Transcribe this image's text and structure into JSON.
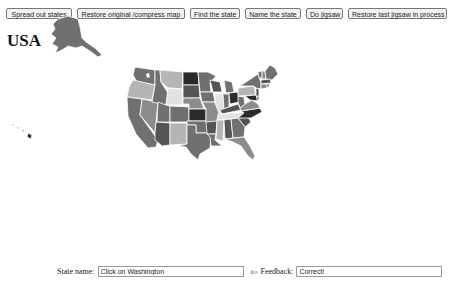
{
  "toolbar": {
    "buttons": [
      {
        "label": "Spread out states"
      },
      {
        "label": "Restore original /compress map"
      },
      {
        "label": "Find the state"
      },
      {
        "label": "Name the state"
      },
      {
        "label": "Do jigsaw"
      },
      {
        "label": "Restore last jigsaw in process"
      }
    ]
  },
  "map": {
    "title": "USA",
    "colors": {
      "dark": "#2a2a2a",
      "mid_dark": "#555555",
      "mid": "#707070",
      "mid_light": "#8c8c8c",
      "light": "#b5b5b5",
      "very_light": "#e2e2e2",
      "border": "#ffffff"
    }
  },
  "bottom_bar": {
    "state_name_label": "State name:",
    "state_name_value": "Click on Washington",
    "arrow_icon": "⇦",
    "feedback_label": "Feedback:",
    "feedback_value": "Correct!"
  }
}
